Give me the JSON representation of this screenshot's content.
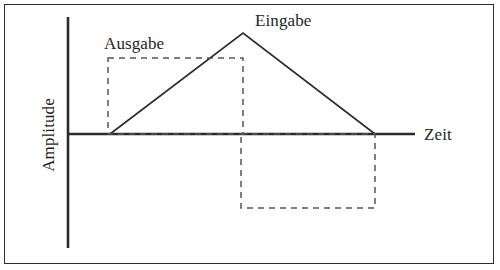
{
  "figure": {
    "type": "line-diagram",
    "title": "",
    "background_color": "#ffffff",
    "border_color": "#2e2e2e",
    "line_color": "#2b2b2b",
    "dash_color": "#555555"
  },
  "labels": {
    "input_signal": "Eingabe",
    "output_signal": "Ausgabe",
    "x_axis": "Zeit",
    "y_axis": "Amplitude"
  },
  "chart_data": {
    "type": "line",
    "title": "",
    "xlabel": "Zeit",
    "ylabel": "Amplitude",
    "grid": false,
    "legend_position": "inline-annotations",
    "axes": {
      "x_axis_y_px": 134,
      "x_axis_start_px": 68,
      "x_axis_end_px": 415,
      "y_axis_x_px": 68,
      "y_axis_top_px": 17,
      "y_axis_bottom_px": 248
    },
    "series": [
      {
        "name": "Eingabe",
        "style": "solid",
        "points_px": [
          [
            110,
            134
          ],
          [
            243,
            33
          ],
          [
            375,
            134
          ]
        ],
        "description": "Dreieckiger Eingangsimpuls: linearer Anstieg bis zum Maximum, dann linearer Abfall zur Nulllinie"
      },
      {
        "name": "Ausgabe",
        "style": "dashed",
        "shapes_px": [
          {
            "kind": "rect",
            "x": 108,
            "y": 58,
            "width": 135,
            "height": 76
          },
          {
            "kind": "rect",
            "x": 241,
            "y": 134,
            "width": 134,
            "height": 74
          }
        ],
        "description": "Rechteckige Ausgangsantwort: positiver Block gefolgt von negativem Block"
      }
    ],
    "annotations": [
      {
        "text": "Eingabe",
        "x_px": 255,
        "y_px": 12
      },
      {
        "text": "Ausgabe",
        "x_px": 104,
        "y_px": 35
      },
      {
        "text": "Zeit",
        "x_px": 424,
        "y_px": 126
      },
      {
        "text": "Amplitude",
        "x_px": 48,
        "y_px": 135,
        "rotation_deg": -90
      }
    ]
  }
}
